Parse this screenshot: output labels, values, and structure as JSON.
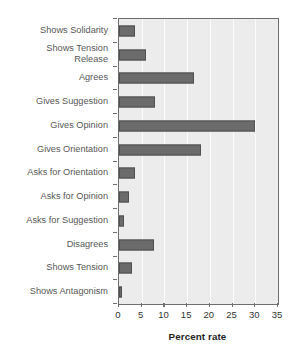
{
  "chart_data": {
    "type": "bar",
    "orientation": "horizontal",
    "title": "",
    "xlabel": "Percent rate",
    "ylabel": "",
    "xlim": [
      0,
      35
    ],
    "xticks": [
      0,
      5,
      10,
      15,
      20,
      25,
      30,
      35
    ],
    "grid": true,
    "grid_axis": "x",
    "legend": false,
    "legend_position": "none",
    "bar_color": "#6b6b6b",
    "plot_background": "#ececec",
    "gridline_color": "#fbfbfb",
    "categories": [
      "Shows Solidarity",
      "Shows Tension\nRelease",
      "Agrees",
      "Gives Suggestion",
      "Gives Opinion",
      "Gives Orientation",
      "Asks for Orientation",
      "Asks for Opinion",
      "Asks for Suggestion",
      "Disagrees",
      "Shows Tension",
      "Shows Antagonism"
    ],
    "values": [
      3.5,
      6.0,
      16.5,
      8.0,
      30.0,
      18.0,
      3.5,
      2.3,
      1.2,
      7.8,
      2.8,
      0.7
    ]
  }
}
